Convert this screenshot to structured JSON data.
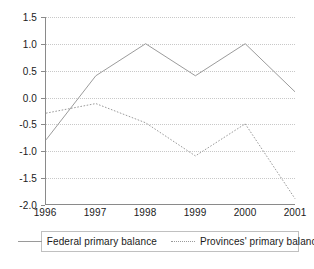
{
  "chart_data": {
    "type": "line",
    "title": "",
    "subtitle": "",
    "xlabel": "",
    "ylabel": "",
    "categories": [
      "1996",
      "1997",
      "1998",
      "1999",
      "2000",
      "2001"
    ],
    "x": [
      1996,
      1997,
      1998,
      1999,
      2000,
      2001
    ],
    "xlim": [
      1996,
      2001
    ],
    "ylim": [
      -2.0,
      1.5
    ],
    "yticks": [
      1.5,
      1.0,
      0.5,
      0.0,
      -0.5,
      -1.0,
      -1.5,
      -2.0
    ],
    "ytick_labels": [
      "1.5",
      "1.0",
      "0.5",
      "0.0",
      "-0.5",
      "-1.0",
      "-1.5",
      "-2.0"
    ],
    "xtick_labels": [
      "1996",
      "1997",
      "1998",
      "1999",
      "2000",
      "2001"
    ],
    "grid": "horizontal-dotted",
    "legend_position": "below",
    "series": [
      {
        "name": "Federal primary balance",
        "style": "solid",
        "color": "#9a9a9a",
        "values": [
          -0.8,
          0.4,
          1.0,
          0.4,
          1.0,
          0.1
        ]
      },
      {
        "name": "Provinces' primary balance",
        "style": "dotted",
        "color": "#9a9a9a",
        "values": [
          -0.3,
          -0.12,
          -0.48,
          -1.1,
          -0.5,
          -1.9
        ]
      }
    ]
  },
  "legend": {
    "entries": [
      {
        "label": "Federal primary balance"
      },
      {
        "label": "Provinces' primary balance"
      }
    ]
  },
  "colors": {
    "axis": "#8a8a8a",
    "grid": "#c8c8c8",
    "series": "#9a9a9a",
    "text": "#1a1a1a",
    "background": "#ffffff"
  }
}
